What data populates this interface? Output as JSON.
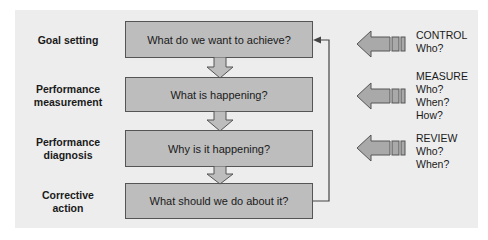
{
  "stages": [
    {
      "label": "Goal setting",
      "question": "What do we want to achieve?"
    },
    {
      "label": "Performance measurement",
      "question": "What is happening?"
    },
    {
      "label": "Performance diagnosis",
      "question": "Why is it happening?"
    },
    {
      "label": "Corrective action",
      "question": "What should we do about it?"
    }
  ],
  "stage_label_lines": [
    [
      "Goal setting"
    ],
    [
      "Performance",
      "measurement"
    ],
    [
      "Performance",
      "diagnosis"
    ],
    [
      "Corrective",
      "action"
    ]
  ],
  "controls": [
    {
      "title": "CONTROL",
      "questions": [
        "Who?"
      ]
    },
    {
      "title": "MEASURE",
      "questions": [
        "Who?",
        "When?",
        "How?"
      ]
    },
    {
      "title": "REVIEW",
      "questions": [
        "Who?",
        "When?"
      ]
    }
  ],
  "colors": {
    "panel": "#ededed",
    "box_fill": "#bdbdbd",
    "box_border": "#555555",
    "arrow_fill": "#a9a9a9",
    "line": "#444444"
  }
}
